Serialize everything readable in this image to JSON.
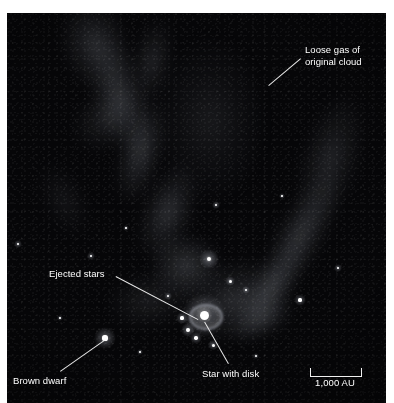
{
  "figure": {
    "type": "astronomical-photograph",
    "caption_fragment": "",
    "scene": "Star-forming region showing loose gas from the original cloud, ejected stars, a star with a circumstellar disk, and a brown dwarf"
  },
  "annotations": [
    {
      "id": "loose-gas",
      "label": "Loose gas of\noriginal cloud",
      "text_x": 305,
      "text_y": 44,
      "leader": {
        "x1": 301,
        "y1": 59,
        "x2": 269,
        "y2": 86
      }
    },
    {
      "id": "ejected-stars",
      "label": "Ejected stars",
      "text_x": 49,
      "text_y": 268,
      "leader": {
        "x1": 116,
        "y1": 276,
        "x2": 198,
        "y2": 319
      }
    },
    {
      "id": "brown-dwarf",
      "label": "Brown dwarf",
      "text_x": 13,
      "text_y": 375,
      "leader": {
        "x1": 60,
        "y1": 371,
        "x2": 104,
        "y2": 340
      }
    },
    {
      "id": "star-with-disk",
      "label": "Star with disk",
      "text_x": 202,
      "text_y": 368,
      "leader": {
        "x1": 228,
        "y1": 364,
        "x2": 204,
        "y2": 322
      }
    }
  ],
  "scale_bar": {
    "label": "1,000 AU",
    "x": 310,
    "y": 368,
    "width": 50
  },
  "colors": {
    "background": "#ffffff",
    "photo_background": "#060608",
    "annotation_text": "#ffffff",
    "leader_line": "#e8e8e8",
    "gas": "#9aa0a6",
    "star": "#ffffff"
  },
  "features": {
    "gas_clouds": [
      {
        "cx": 96,
        "cy": 46,
        "rx": 34,
        "ry": 52,
        "op": 0.2,
        "rot": -18
      },
      {
        "cx": 120,
        "cy": 96,
        "rx": 26,
        "ry": 60,
        "op": 0.22,
        "rot": -14
      },
      {
        "cx": 152,
        "cy": 62,
        "rx": 20,
        "ry": 46,
        "op": 0.16,
        "rot": 10
      },
      {
        "cx": 141,
        "cy": 150,
        "rx": 22,
        "ry": 56,
        "op": 0.24,
        "rot": 14
      },
      {
        "cx": 168,
        "cy": 212,
        "rx": 26,
        "ry": 52,
        "op": 0.22,
        "rot": 20
      },
      {
        "cx": 108,
        "cy": 118,
        "rx": 40,
        "ry": 30,
        "op": 0.14,
        "rot": -40
      },
      {
        "cx": 186,
        "cy": 266,
        "rx": 38,
        "ry": 34,
        "op": 0.24,
        "rot": 0
      },
      {
        "cx": 236,
        "cy": 300,
        "rx": 60,
        "ry": 40,
        "op": 0.2,
        "rot": -18
      },
      {
        "cx": 300,
        "cy": 236,
        "rx": 24,
        "ry": 74,
        "op": 0.24,
        "rot": 28
      },
      {
        "cx": 268,
        "cy": 292,
        "rx": 20,
        "ry": 60,
        "op": 0.22,
        "rot": 34
      },
      {
        "cx": 330,
        "cy": 160,
        "rx": 30,
        "ry": 70,
        "op": 0.16,
        "rot": 16
      },
      {
        "cx": 210,
        "cy": 120,
        "rx": 60,
        "ry": 90,
        "op": 0.1,
        "rot": 0
      },
      {
        "cx": 150,
        "cy": 300,
        "rx": 44,
        "ry": 30,
        "op": 0.12,
        "rot": -10
      },
      {
        "cx": 64,
        "cy": 200,
        "rx": 22,
        "ry": 40,
        "op": 0.08,
        "rot": -26
      },
      {
        "cx": 264,
        "cy": 318,
        "rx": 34,
        "ry": 20,
        "op": 0.18,
        "rot": -30
      }
    ],
    "stars": [
      {
        "x": 204,
        "y": 315,
        "r": 4.5,
        "glow": 22,
        "name": "star-with-disk",
        "ring": true
      },
      {
        "x": 105,
        "y": 338,
        "r": 2.6,
        "glow": 11,
        "name": "brown-dwarf"
      },
      {
        "x": 209,
        "y": 259,
        "r": 2.4,
        "glow": 10,
        "name": "bright-star-upper"
      },
      {
        "x": 188,
        "y": 330,
        "r": 1.9,
        "glow": 7,
        "name": "ejected-star-a"
      },
      {
        "x": 196,
        "y": 338,
        "r": 1.7,
        "glow": 6,
        "name": "ejected-star-b"
      },
      {
        "x": 182,
        "y": 318,
        "r": 1.6,
        "glow": 6,
        "name": "ejected-star-c"
      },
      {
        "x": 213,
        "y": 345,
        "r": 1.5,
        "glow": 5,
        "name": "ejected-star-d"
      },
      {
        "x": 230,
        "y": 281,
        "r": 1.5,
        "glow": 5,
        "name": "field-star-1"
      },
      {
        "x": 246,
        "y": 290,
        "r": 1.2,
        "glow": 4,
        "name": "field-star-2"
      },
      {
        "x": 300,
        "y": 300,
        "r": 1.6,
        "glow": 6,
        "name": "field-star-3"
      },
      {
        "x": 168,
        "y": 296,
        "r": 1.2,
        "glow": 4,
        "name": "field-star-4"
      },
      {
        "x": 216,
        "y": 205,
        "r": 1.2,
        "glow": 4,
        "name": "field-star-5"
      },
      {
        "x": 91,
        "y": 256,
        "r": 1.1,
        "glow": 4,
        "name": "field-star-6"
      },
      {
        "x": 18,
        "y": 244,
        "r": 1.1,
        "glow": 4,
        "name": "field-star-7"
      },
      {
        "x": 140,
        "y": 352,
        "r": 1.0,
        "glow": 3,
        "name": "field-star-8"
      },
      {
        "x": 256,
        "y": 356,
        "r": 1.0,
        "glow": 3,
        "name": "field-star-9"
      },
      {
        "x": 338,
        "y": 268,
        "r": 1.1,
        "glow": 4,
        "name": "field-star-10"
      },
      {
        "x": 60,
        "y": 318,
        "r": 0.9,
        "glow": 3,
        "name": "field-star-11"
      },
      {
        "x": 282,
        "y": 196,
        "r": 0.9,
        "glow": 3,
        "name": "field-star-12"
      },
      {
        "x": 126,
        "y": 228,
        "r": 0.9,
        "glow": 3,
        "name": "field-star-13"
      }
    ]
  }
}
